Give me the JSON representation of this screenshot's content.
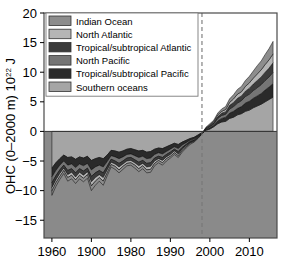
{
  "chart_data": {
    "type": "area",
    "title": "",
    "xlabel": "",
    "ylabel": "OHC (0–2000 m) 10²² J",
    "ylabel_main": "OHC (0–2000 m) 10",
    "ylabel_sup": "22",
    "ylabel_tail": " J",
    "xlim": [
      1958,
      2017
    ],
    "ylim": [
      -18,
      20
    ],
    "grid": false,
    "stacked": true,
    "legend_position": "upper-left",
    "xticks": [
      1960,
      1900,
      1980,
      1990,
      2000,
      2010
    ],
    "xtick_values": [
      1960,
      1970,
      1980,
      1990,
      2000,
      2010
    ],
    "yticks": [
      -15,
      -10,
      -5,
      0,
      5,
      10,
      15,
      20
    ],
    "annotations": [
      {
        "name": "reference-period-line",
        "type": "vline",
        "x": 1998,
        "style": "dashed",
        "color": "#777777"
      }
    ],
    "colors": {
      "indian_ocean": "#8d8d8d",
      "north_atlantic": "#b5b5b5",
      "tropical_subtropical_atlantic": "#3b3b3b",
      "north_pacific": "#757575",
      "tropical_subtropical_pacific": "#2a2a2a",
      "southern_oceans": "#a5a5a5",
      "below_zero_fill": "#8a8a8a",
      "frame": "#4a4a4a",
      "text": "#000000"
    },
    "legend": [
      {
        "label": "Indian Ocean",
        "color": "#8d8d8d"
      },
      {
        "label": "North Atlantic",
        "color": "#b5b5b5"
      },
      {
        "label": "Tropical/subtropical Atlantic",
        "color": "#3b3b3b"
      },
      {
        "label": "North Pacific",
        "color": "#757575"
      },
      {
        "label": "Tropical/subtropical Pacific",
        "color": "#2a2a2a"
      },
      {
        "label": "Southern oceans",
        "color": "#a5a5a5"
      }
    ],
    "x": [
      1960,
      1961,
      1962,
      1963,
      1964,
      1965,
      1966,
      1967,
      1968,
      1969,
      1970,
      1971,
      1972,
      1973,
      1974,
      1975,
      1976,
      1977,
      1978,
      1979,
      1980,
      1981,
      1982,
      1983,
      1984,
      1985,
      1986,
      1987,
      1988,
      1989,
      1990,
      1991,
      1992,
      1993,
      1994,
      1995,
      1996,
      1997,
      1998,
      1999,
      2000,
      2001,
      2002,
      2003,
      2004,
      2005,
      2006,
      2007,
      2008,
      2009,
      2010,
      2011,
      2012,
      2013,
      2014,
      2015,
      2016
    ],
    "series": [
      {
        "name": "Southern oceans",
        "color": "#a5a5a5",
        "values": [
          -6.2,
          -5.3,
          -4.6,
          -4.0,
          -4.4,
          -4.3,
          -4.7,
          -4.3,
          -4.5,
          -4.2,
          -4.9,
          -4.6,
          -4.4,
          -4.6,
          -4.0,
          -3.2,
          -3.3,
          -3.5,
          -3.3,
          -3.0,
          -2.9,
          -3.1,
          -3.3,
          -3.2,
          -3.5,
          -3.4,
          -3.0,
          -2.8,
          -2.9,
          -2.6,
          -2.3,
          -2.0,
          -2.2,
          -1.8,
          -1.5,
          -1.2,
          -1.0,
          -0.6,
          -0.2,
          0.2,
          0.4,
          0.8,
          1.3,
          1.6,
          1.7,
          2.2,
          2.4,
          2.8,
          3.0,
          3.4,
          3.6,
          4.0,
          4.3,
          4.6,
          5.0,
          5.4,
          5.8
        ]
      },
      {
        "name": "Tropical/subtropical Pacific",
        "color": "#2a2a2a",
        "values": [
          -1.5,
          -1.3,
          -1.1,
          -1.0,
          -1.3,
          -1.2,
          -1.4,
          -1.2,
          -1.3,
          -1.2,
          -1.6,
          -1.4,
          -1.3,
          -1.4,
          -1.1,
          -0.9,
          -1.0,
          -1.1,
          -1.0,
          -0.9,
          -0.9,
          -1.0,
          -1.1,
          -1.0,
          -1.1,
          -1.1,
          -0.9,
          -0.8,
          -0.9,
          -0.8,
          -0.7,
          -0.6,
          -0.7,
          -0.5,
          -0.4,
          -0.3,
          -0.3,
          -0.2,
          -0.1,
          0.1,
          0.2,
          0.3,
          0.5,
          0.6,
          0.7,
          0.9,
          1.0,
          1.1,
          1.2,
          1.4,
          1.5,
          1.6,
          1.7,
          1.8,
          2.0,
          2.1,
          2.3
        ]
      },
      {
        "name": "North Pacific",
        "color": "#757575",
        "values": [
          -1.0,
          -0.9,
          -0.8,
          -0.7,
          -0.9,
          -0.8,
          -0.9,
          -0.8,
          -0.9,
          -0.8,
          -1.1,
          -1.0,
          -0.9,
          -1.0,
          -0.8,
          -0.6,
          -0.7,
          -0.8,
          -0.7,
          -0.6,
          -0.6,
          -0.7,
          -0.8,
          -0.7,
          -0.8,
          -0.8,
          -0.6,
          -0.6,
          -0.6,
          -0.5,
          -0.5,
          -0.4,
          -0.5,
          -0.4,
          -0.3,
          -0.2,
          -0.2,
          -0.1,
          -0.1,
          0.1,
          0.2,
          0.2,
          0.4,
          0.5,
          0.5,
          0.7,
          0.8,
          0.9,
          1.0,
          1.1,
          1.2,
          1.3,
          1.4,
          1.5,
          1.6,
          1.7,
          1.9
        ]
      },
      {
        "name": "Tropical/subtropical Atlantic",
        "color": "#3b3b3b",
        "values": [
          -0.8,
          -0.7,
          -0.6,
          -0.5,
          -0.7,
          -0.6,
          -0.7,
          -0.6,
          -0.7,
          -0.6,
          -0.9,
          -0.8,
          -0.7,
          -0.8,
          -0.6,
          -0.5,
          -0.5,
          -0.6,
          -0.5,
          -0.5,
          -0.5,
          -0.5,
          -0.6,
          -0.5,
          -0.6,
          -0.6,
          -0.5,
          -0.4,
          -0.5,
          -0.4,
          -0.4,
          -0.3,
          -0.4,
          -0.3,
          -0.2,
          -0.2,
          -0.1,
          -0.1,
          0.0,
          0.1,
          0.2,
          0.2,
          0.3,
          0.4,
          0.4,
          0.6,
          0.7,
          0.8,
          0.8,
          0.9,
          1.0,
          1.1,
          1.2,
          1.3,
          1.4,
          1.5,
          1.6
        ]
      },
      {
        "name": "North Atlantic",
        "color": "#b5b5b5",
        "values": [
          -0.6,
          -0.5,
          -0.5,
          -0.4,
          -0.5,
          -0.5,
          -0.5,
          -0.5,
          -0.5,
          -0.5,
          -0.7,
          -0.6,
          -0.5,
          -0.6,
          -0.5,
          -0.4,
          -0.4,
          -0.5,
          -0.4,
          -0.4,
          -0.4,
          -0.4,
          -0.5,
          -0.4,
          -0.5,
          -0.5,
          -0.4,
          -0.3,
          -0.4,
          -0.3,
          -0.3,
          -0.3,
          -0.3,
          -0.2,
          -0.2,
          -0.1,
          -0.1,
          -0.1,
          0.0,
          0.1,
          0.1,
          0.2,
          0.3,
          0.3,
          0.4,
          0.5,
          0.6,
          0.7,
          0.7,
          0.8,
          0.9,
          1.0,
          1.1,
          1.2,
          1.3,
          1.4,
          1.5
        ]
      },
      {
        "name": "Indian Ocean",
        "color": "#8d8d8d",
        "values": [
          -0.7,
          -0.6,
          -0.5,
          -0.5,
          -0.6,
          -0.6,
          -0.6,
          -0.6,
          -0.6,
          -0.6,
          -0.8,
          -0.7,
          -0.6,
          -0.7,
          -0.5,
          -0.4,
          -0.5,
          -0.5,
          -0.5,
          -0.4,
          -0.4,
          -0.5,
          -0.5,
          -0.5,
          -0.5,
          -0.5,
          -0.4,
          -0.4,
          -0.4,
          -0.4,
          -0.3,
          -0.3,
          -0.3,
          -0.3,
          -0.2,
          -0.2,
          -0.1,
          -0.1,
          0.0,
          0.1,
          0.2,
          0.2,
          0.3,
          0.4,
          0.5,
          0.6,
          0.7,
          0.8,
          0.9,
          1.0,
          1.1,
          1.2,
          1.4,
          1.5,
          1.7,
          1.9,
          2.1
        ]
      }
    ],
    "total_note": "Stacked totals range from about -16.5 (1970) to about +17.5 (2016)"
  }
}
